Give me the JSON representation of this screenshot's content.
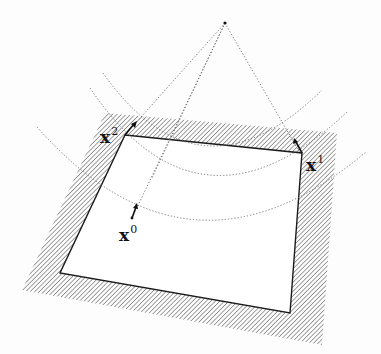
{
  "figure": {
    "labels": [
      {
        "id": "x0",
        "base": "x",
        "sup": "0"
      },
      {
        "id": "x1",
        "base": "x",
        "sup": "1"
      },
      {
        "id": "x2",
        "base": "x",
        "sup": "2"
      }
    ],
    "colors": {
      "line": "#1a1a1a",
      "hatch": "#555555",
      "dotted": "#666666",
      "background": "#fdfdfd"
    }
  }
}
